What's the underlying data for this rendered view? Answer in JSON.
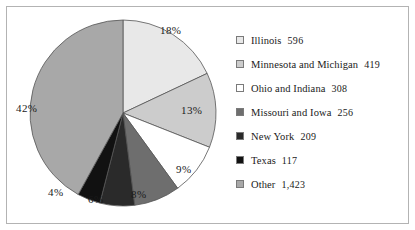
{
  "chart_data": {
    "type": "pie",
    "title": "",
    "legend_position": "right",
    "categories": [
      "Illinois",
      "Minnesota and Michigan",
      "Ohio and Indiana",
      "Missouri and Iowa",
      "New York",
      "Texas",
      "Other"
    ],
    "values": [
      596,
      419,
      308,
      256,
      209,
      117,
      1423
    ],
    "percent_labels": [
      "18%",
      "13%",
      "9%",
      "8%",
      "6%",
      "4%",
      "42%"
    ],
    "percents": [
      18,
      13,
      9,
      8,
      6,
      4,
      42
    ],
    "colors": [
      "#e8e8e8",
      "#cccccc",
      "#ffffff",
      "#6e6e6e",
      "#2a2a2a",
      "#111111",
      "#a8a8a8"
    ],
    "start_angle_deg": 0,
    "direction": "clockwise",
    "slice_outline": "#555555"
  },
  "legend": {
    "items": [
      {
        "label": "Illinois",
        "value": "596",
        "color": "#e8e8e8"
      },
      {
        "label": "Minnesota and Michigan",
        "value": "419",
        "color": "#cccccc"
      },
      {
        "label": "Ohio and Indiana",
        "value": "308",
        "color": "#ffffff"
      },
      {
        "label": "Missouri and Iowa",
        "value": "256",
        "color": "#6e6e6e"
      },
      {
        "label": "New York",
        "value": "209",
        "color": "#2a2a2a"
      },
      {
        "label": "Texas",
        "value": "117",
        "color": "#111111"
      },
      {
        "label": "Other",
        "value": "1,423",
        "color": "#a8a8a8"
      }
    ]
  },
  "pie_labels": {
    "illinois": "18%",
    "minnesota_michigan": "13%",
    "ohio_indiana": "9%",
    "missouri_iowa": "8%",
    "new_york": "6%",
    "texas": "4%",
    "other": "42%"
  }
}
